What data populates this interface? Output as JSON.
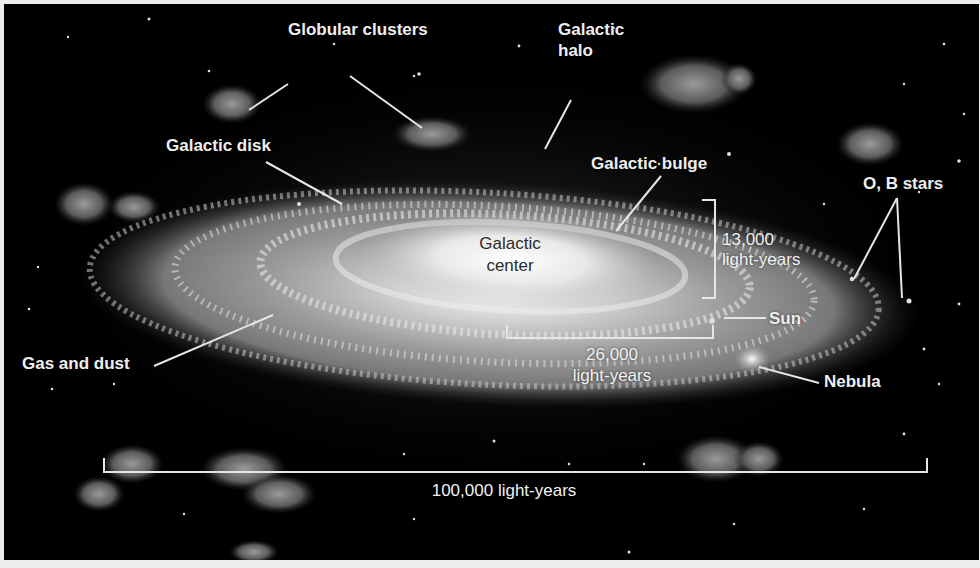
{
  "diagram": {
    "labels": {
      "globular_clusters": "Globular clusters",
      "galactic_halo_line1": "Galactic",
      "galactic_halo_line2": "halo",
      "galactic_disk": "Galactic disk",
      "galactic_bulge": "Galactic bulge",
      "ob_stars": "O, B stars",
      "galactic_center_line1": "Galactic",
      "galactic_center_line2": "center",
      "bulge_thickness_value": "13,000",
      "bulge_thickness_unit": "light-years",
      "sun": "Sun",
      "sun_distance_value": "26,000",
      "sun_distance_unit": "light-years",
      "nebula": "Nebula",
      "gas_and_dust": "Gas and dust",
      "galaxy_diameter": "100,000 light-years"
    },
    "colors": {
      "background": "#000000",
      "border": "#ececec",
      "label_text": "#eeeeee",
      "center_text": "#2a2a2a",
      "leader_lines": "#e6e6e6"
    }
  }
}
